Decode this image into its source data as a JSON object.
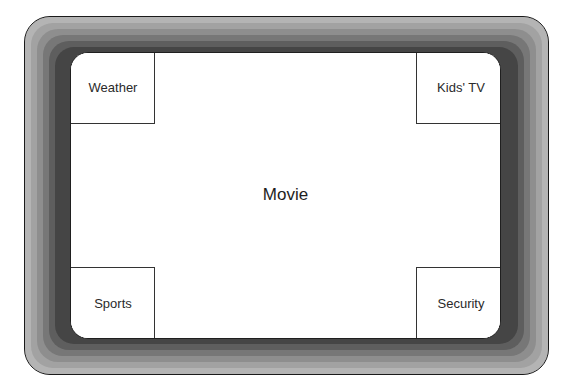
{
  "diagram": {
    "type": "tv-screen-layout",
    "main_region": {
      "label": "Movie"
    },
    "pip_regions": [
      {
        "position": "top-left",
        "label": "Weather"
      },
      {
        "position": "top-right",
        "label": "Kids' TV"
      },
      {
        "position": "bottom-left",
        "label": "Sports"
      },
      {
        "position": "bottom-right",
        "label": "Security"
      }
    ],
    "colors": {
      "bezel_outer": "#b4b4b4",
      "bezel_inner": "#2a2a2a",
      "screen": "#ffffff",
      "outline": "#1a1a1a",
      "text": "#222222"
    }
  }
}
